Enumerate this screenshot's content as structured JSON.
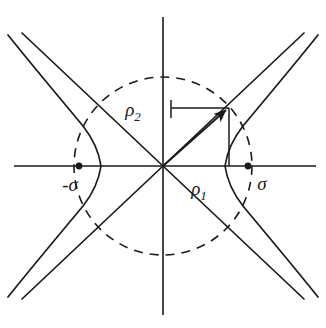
{
  "figure": {
    "background_color": "#ffffff",
    "stroke_color": "#1a1a1a",
    "labels": {
      "rho1": "ρ",
      "rho1_sub": "1",
      "rho2": "ρ",
      "rho2_sub": "2",
      "sigma_positive": "σ",
      "sigma_negative": "-σ"
    },
    "geometry": {
      "origin": [
        163,
        166
      ],
      "x_axis_span": [
        14,
        316
      ],
      "y_axis_span": [
        17,
        315
      ],
      "circle_radius": 89,
      "hyperbola_vertex_a": 62,
      "focus_distance_sigma": 84,
      "point_on_branch": [
        228,
        108
      ],
      "rho2_leader_y": 108,
      "rho1_drop_x": 228
    },
    "elements": [
      "x-axis",
      "y-axis",
      "asymptote-up-right",
      "asymptote-up-left",
      "right-hyperbola-branch",
      "left-hyperbola-branch",
      "dashed-focal-circle",
      "focus-dot-positive",
      "focus-dot-negative",
      "radius-vector-arrow",
      "rho2-horizontal-leader",
      "rho1-vertical-drop"
    ]
  }
}
